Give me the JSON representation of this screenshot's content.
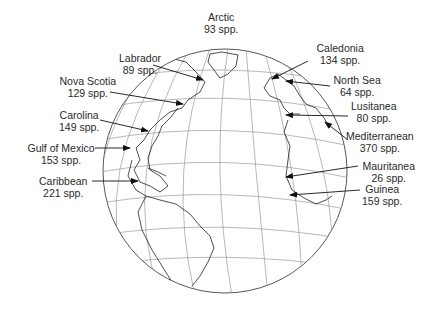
{
  "globe": {
    "cx": 225,
    "cy": 171,
    "r": 122,
    "stroke": "#333333",
    "grid": "#888888"
  },
  "regions": [
    {
      "id": "arctic",
      "name": "Arctic",
      "count": "93 spp.",
      "lx": 221,
      "ly": 11,
      "align": "center"
    },
    {
      "id": "labrador",
      "name": "Labrador",
      "count": "89 spp.",
      "lx": 140,
      "ly": 52,
      "align": "center"
    },
    {
      "id": "nova-scotia",
      "name": "Nova Scotia",
      "count": "129 spp.",
      "lx": 88,
      "ly": 75,
      "align": "center"
    },
    {
      "id": "carolina",
      "name": "Carolina",
      "count": "149 spp.",
      "lx": 79,
      "ly": 109,
      "align": "center"
    },
    {
      "id": "gulf-of-mexico",
      "name": "Gulf of Mexico",
      "count": "153 spp.",
      "lx": 61,
      "ly": 142,
      "align": "center"
    },
    {
      "id": "caribbean",
      "name": "Caribbean",
      "count": "221 spp.",
      "lx": 63,
      "ly": 175,
      "align": "center"
    },
    {
      "id": "caledonia",
      "name": "Caledonia",
      "count": "134 spp.",
      "lx": 340,
      "ly": 42,
      "align": "center"
    },
    {
      "id": "north-sea",
      "name": "North Sea",
      "count": "64 spp.",
      "lx": 357,
      "ly": 74,
      "align": "center"
    },
    {
      "id": "lusitanea",
      "name": "Lusitanea",
      "count": "80 spp.",
      "lx": 374,
      "ly": 100,
      "align": "center"
    },
    {
      "id": "mediterranean",
      "name": "Mediterranean",
      "count": "370 spp.",
      "lx": 380,
      "ly": 130,
      "align": "center"
    },
    {
      "id": "mauritanea",
      "name": "Mauritanea",
      "count": "26 spp.",
      "lx": 389,
      "ly": 160,
      "align": "center"
    },
    {
      "id": "guinea",
      "name": "Guinea",
      "count": "159 spp.",
      "lx": 382,
      "ly": 183,
      "align": "center"
    }
  ],
  "arrows": [
    {
      "id": "labrador",
      "x1": 153,
      "y1": 65,
      "x2": 203,
      "y2": 80
    },
    {
      "id": "nova-scotia",
      "x1": 110,
      "y1": 92,
      "x2": 183,
      "y2": 104
    },
    {
      "id": "carolina",
      "x1": 100,
      "y1": 120,
      "x2": 148,
      "y2": 131
    },
    {
      "id": "gulf-of-mexico",
      "x1": 95,
      "y1": 148,
      "x2": 130,
      "y2": 148
    },
    {
      "id": "caribbean",
      "x1": 92,
      "y1": 181,
      "x2": 138,
      "y2": 181
    },
    {
      "id": "caledonia",
      "x1": 308,
      "y1": 61,
      "x2": 272,
      "y2": 79
    },
    {
      "id": "north-sea",
      "x1": 330,
      "y1": 86,
      "x2": 286,
      "y2": 81
    },
    {
      "id": "lusitanea",
      "x1": 348,
      "y1": 116,
      "x2": 286,
      "y2": 115
    },
    {
      "id": "mediterranean",
      "x1": 348,
      "y1": 140,
      "x2": 325,
      "y2": 122
    },
    {
      "id": "mauritanea",
      "x1": 358,
      "y1": 166,
      "x2": 286,
      "y2": 177
    },
    {
      "id": "guinea",
      "x1": 360,
      "y1": 190,
      "x2": 290,
      "y2": 195
    }
  ]
}
